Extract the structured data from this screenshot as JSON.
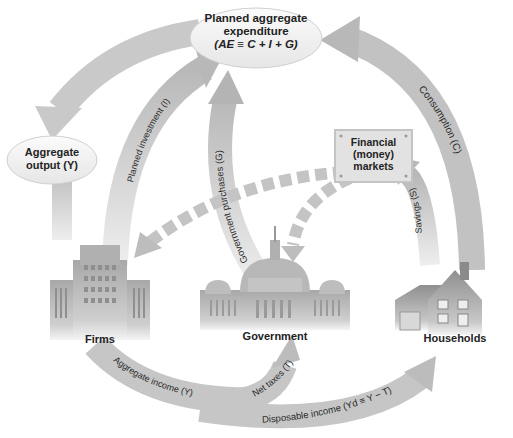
{
  "nodes": {
    "planned_expenditure": {
      "line1": "Planned aggregate",
      "line2": "expenditure",
      "line3": "(AE ≡ C + I + G)"
    },
    "aggregate_output": {
      "line1": "Aggregate",
      "line2": "output (Y)"
    },
    "financial_markets": {
      "line1": "Financial",
      "line2": "(money)",
      "line3": "markets"
    },
    "firms": {
      "label": "Firms"
    },
    "government": {
      "label": "Government"
    },
    "households": {
      "label": "Households"
    }
  },
  "flows": {
    "consumption": "Consumption (C)",
    "planned_investment": "Planned investment (I)",
    "government_purchases": "Government purchases (G)",
    "savings": "Savings (S)",
    "aggregate_income": "Aggregate income (Y)",
    "net_taxes": "Net taxes (T)",
    "disposable_income": "Disposable income (Yd ≡ Y − T)"
  },
  "colors": {
    "arrow": "#c4c4c4",
    "arrow_dark": "#a9a9a9",
    "dashed_arrow": "#bdbdbd",
    "text": "#222222"
  }
}
